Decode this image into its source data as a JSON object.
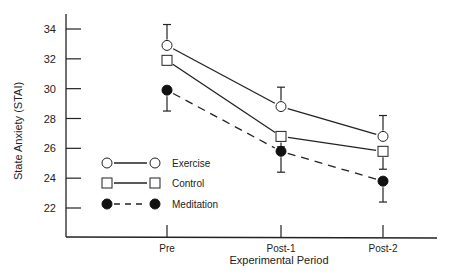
{
  "chart_data": {
    "type": "line",
    "title": "",
    "xlabel": "Experimental Period",
    "ylabel": "State Anxiety (STAI)",
    "categories": [
      "Pre",
      "Post-1",
      "Post-2"
    ],
    "yticks": [
      22,
      24,
      26,
      28,
      30,
      32,
      34
    ],
    "ylim": [
      20.2,
      35.3
    ],
    "grid": false,
    "legend_position": "inside-lower-left",
    "series": [
      {
        "name": "Exercise",
        "marker": "open-circle",
        "line": "solid",
        "values": [
          32.9,
          28.8,
          26.8
        ],
        "error_up": [
          34.3,
          30.1,
          28.2
        ]
      },
      {
        "name": "Control",
        "marker": "open-square",
        "line": "solid",
        "values": [
          31.9,
          26.8,
          25.8
        ],
        "error_up": [
          null,
          null,
          null
        ],
        "error_down": [
          null,
          26.1,
          24.6
        ]
      },
      {
        "name": "Meditation",
        "marker": "filled-circle",
        "line": "dashed",
        "values": [
          29.9,
          25.8,
          23.8
        ],
        "error_down": [
          28.5,
          24.4,
          22.4
        ]
      }
    ]
  },
  "legend": {
    "items": [
      {
        "label": "Exercise"
      },
      {
        "label": "Control"
      },
      {
        "label": "Meditation"
      }
    ]
  }
}
